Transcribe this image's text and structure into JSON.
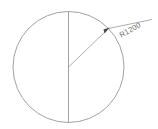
{
  "drawing": {
    "title": "Circle with radius dimension",
    "background_color": "#ffffff",
    "line_color": "#8a8a8a",
    "dimension_color": "#6e6e6e",
    "circle": {
      "center_x": 68.5,
      "center_y": 67,
      "radius_px": 55.5
    },
    "centerline": {
      "orientation": "vertical",
      "x": 68.5,
      "y_start": 11.5,
      "y_end": 122.5
    },
    "radius_dimension": {
      "label": "R1200",
      "value": 1200,
      "prefix": "R",
      "angle_deg": 45,
      "label_rotation_deg": -29,
      "leader_start_x": 68.5,
      "leader_start_y": 67,
      "arrow_x": 108,
      "arrow_y": 28,
      "leader_end_x": 152,
      "leader_end_y": 19
    }
  },
  "header": {
    "clipped_left_text": "",
    "clipped_right_text": ""
  }
}
